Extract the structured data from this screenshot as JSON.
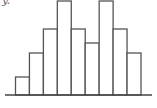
{
  "chart_data": {
    "type": "bar",
    "title": "",
    "xlabel": "",
    "ylabel": "y",
    "categories": [
      "1",
      "2",
      "3",
      "4",
      "5",
      "6",
      "7",
      "8",
      "9"
    ],
    "values": [
      18,
      42,
      66,
      94,
      66,
      52,
      94,
      66,
      42
    ],
    "ylim": [
      0,
      94
    ],
    "grid": false,
    "legend": "none",
    "bar_style": "outline histogram (adjacent bars, no gaps)",
    "colors": {
      "stroke": "#555555",
      "fill": "#ffffff",
      "axis": "#444444"
    }
  },
  "axis_label_text": "y."
}
